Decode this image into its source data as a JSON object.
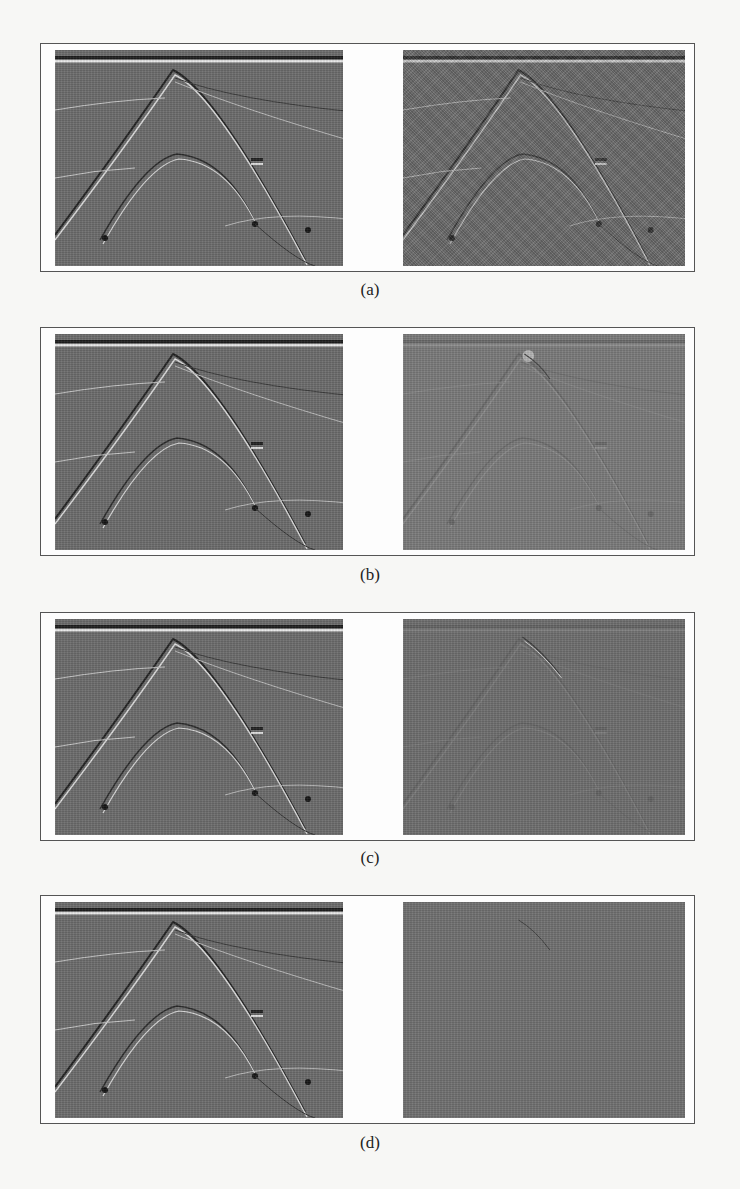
{
  "figure": {
    "panels": [
      {
        "id": "a",
        "caption": "(a)",
        "left_desc": "clean seismic section",
        "right_desc": "noisy seismic section"
      },
      {
        "id": "b",
        "caption": "(b)",
        "left_desc": "denoised seismic section",
        "right_desc": "removed noise residual"
      },
      {
        "id": "c",
        "caption": "(c)",
        "left_desc": "denoised seismic section",
        "right_desc": "removed noise residual"
      },
      {
        "id": "d",
        "caption": "(d)",
        "left_desc": "denoised seismic section",
        "right_desc": "removed noise residual"
      }
    ]
  },
  "colors": {
    "page": "#f7f7f5",
    "frame_border": "#555555",
    "seismic_bg": "#6c6c6c",
    "residual_bg": "#7a7a7a"
  }
}
